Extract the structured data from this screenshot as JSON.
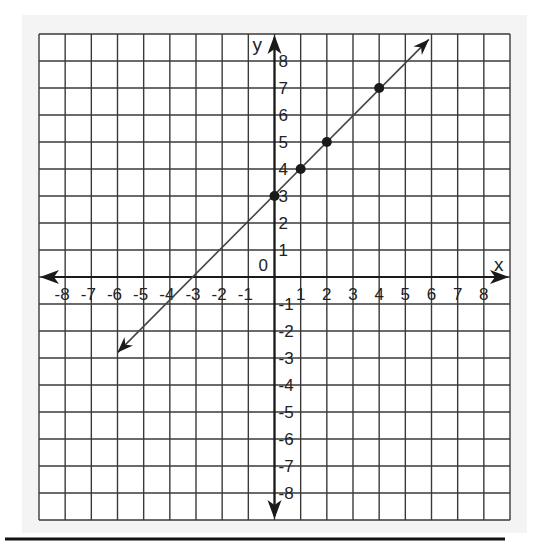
{
  "chart_data": {
    "type": "line",
    "title": "",
    "xlabel": "x",
    "ylabel": "y",
    "origin_label": "0",
    "xlim": [
      -9,
      9
    ],
    "ylim": [
      -9,
      9
    ],
    "grid": true,
    "x_ticks": [
      -8,
      -7,
      -6,
      -5,
      -4,
      -3,
      -2,
      -1,
      1,
      2,
      3,
      4,
      5,
      6,
      7,
      8
    ],
    "y_ticks": [
      8,
      7,
      6,
      5,
      4,
      3,
      2,
      1,
      -1,
      -2,
      -3,
      -4,
      -5,
      -6,
      -7,
      -8
    ],
    "series": [
      {
        "name": "y = x + 3",
        "kind": "line-with-arrows",
        "endpoints": [
          [
            -6,
            -2.8
          ],
          [
            5.9,
            8.8
          ]
        ],
        "points": [
          [
            0,
            3
          ],
          [
            1,
            4
          ],
          [
            2,
            5
          ],
          [
            4,
            7
          ]
        ]
      }
    ],
    "legend": null
  },
  "colors": {
    "grid": "#3a3a3a",
    "axis": "#1a1a1a",
    "line": "#444444",
    "points": "#1a1a1a",
    "paper": "#f4f4f4"
  }
}
